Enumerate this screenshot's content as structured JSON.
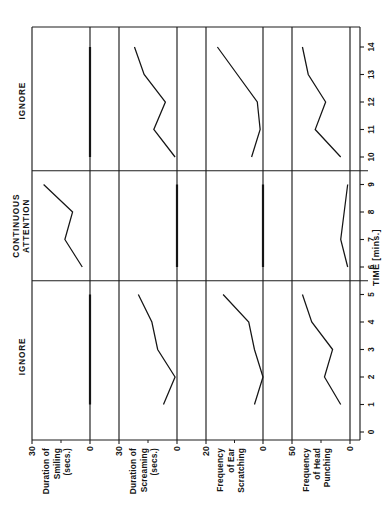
{
  "figure": {
    "orientation": "rotated-90-ccw",
    "time_axis": {
      "title": "TIME [mins.]",
      "ticks": [
        0,
        1,
        2,
        3,
        4,
        5,
        6,
        7,
        8,
        9,
        10,
        11,
        12,
        13,
        14
      ],
      "tick_labels": [
        "0",
        "1",
        "2",
        "3",
        "4",
        "5",
        "6",
        "7",
        "8",
        "9",
        "10",
        "11",
        "12",
        "13",
        "14"
      ],
      "range": [
        0,
        14.6
      ],
      "unit": "mins."
    },
    "phases": [
      {
        "name": "IGNORE",
        "start": 0,
        "end": 5.5
      },
      {
        "name": "CONTINUOUS\nATTENTION",
        "line1": "CONTINUOUS",
        "line2": "ATTENTION",
        "start": 5.5,
        "end": 9.5
      },
      {
        "name": "IGNORE",
        "start": 9.5,
        "end": 14.6
      }
    ],
    "colors": {
      "ink": "#151515",
      "axis": "#1d1d1d",
      "background": "#ffffff"
    }
  },
  "chart_data": {
    "type": "line",
    "title": "",
    "xlabel": "TIME [mins.]",
    "xlim": [
      0,
      14.6
    ],
    "grid": false,
    "legend": "none",
    "annotations": [
      "IGNORE",
      "CONTINUOUS ATTENTION",
      "IGNORE"
    ],
    "x": [
      1,
      2,
      3,
      4,
      5,
      6,
      7,
      8,
      9,
      10,
      11,
      12,
      13,
      14
    ],
    "panels": [
      {
        "label_lines": [
          "Duration  of",
          "Smiling",
          "(secs.)"
        ],
        "label_full": "Duration of Smiling (secs.)",
        "ylabel": "Duration of Smiling (secs.)",
        "ylim": [
          0,
          30
        ],
        "ytick_labels": [
          "0",
          "30"
        ],
        "yticks": [
          0,
          30
        ],
        "yminor": [
          15
        ],
        "values": [
          0,
          0,
          0,
          0,
          0,
          0,
          13,
          9,
          24,
          0,
          0,
          0,
          0,
          0
        ],
        "segments": [
          {
            "phase": "IGNORE",
            "x": [
              1,
              2,
              3,
              4,
              5
            ],
            "y": [
              0,
              0,
              0,
              0,
              0
            ]
          },
          {
            "phase": "CONTINUOUS ATTENTION",
            "x": [
              6,
              7,
              8,
              9
            ],
            "y": [
              4,
              13,
              9,
              24
            ]
          },
          {
            "phase": "IGNORE",
            "x": [
              10,
              11,
              12,
              13,
              14
            ],
            "y": [
              0,
              0,
              0,
              0,
              0
            ]
          }
        ]
      },
      {
        "label_lines": [
          "Duration of",
          "Screaming",
          "(secs.)"
        ],
        "label_full": "Duration of Screaming (secs.)",
        "ylabel": "Duration of Screaming (secs.)",
        "ylim": [
          0,
          30
        ],
        "ytick_labels": [
          "0",
          "30"
        ],
        "yticks": [
          0,
          30
        ],
        "yminor": [
          15
        ],
        "values": [
          7,
          1,
          10,
          13,
          20,
          0,
          0,
          0,
          0,
          18,
          6,
          14,
          8,
          22
        ],
        "segments": [
          {
            "phase": "IGNORE",
            "x": [
              1,
              2,
              3,
              4,
              5
            ],
            "y": [
              7,
              1,
              10,
              13,
              20
            ]
          },
          {
            "phase": "CONTINUOUS ATTENTION",
            "x": [
              6,
              7,
              8,
              9
            ],
            "y": [
              0,
              0,
              0,
              0
            ]
          },
          {
            "phase": "IGNORE",
            "x": [
              10,
              11,
              12,
              13,
              14
            ],
            "y": [
              1,
              12,
              6,
              17,
              22
            ]
          }
        ]
      },
      {
        "label_lines": [
          "Frequency",
          "of  Ear",
          "Scratching"
        ],
        "label_full": "Frequency of Ear Scratching",
        "ylabel": "Frequency of Ear Scratching",
        "ylim": [
          0,
          20
        ],
        "ytick_labels": [
          "0",
          "20"
        ],
        "yticks": [
          0,
          20
        ],
        "yminor": [
          10
        ],
        "values": [
          3,
          0,
          3,
          5,
          14,
          0,
          0,
          0,
          0,
          3,
          1,
          2,
          9,
          16
        ],
        "segments": [
          {
            "phase": "IGNORE",
            "x": [
              1,
              2,
              3,
              4,
              5
            ],
            "y": [
              3,
              0,
              3,
              5,
              14
            ]
          },
          {
            "phase": "CONTINUOUS ATTENTION",
            "x": [
              6,
              7,
              8,
              9
            ],
            "y": [
              0,
              0,
              0,
              0
            ]
          },
          {
            "phase": "IGNORE",
            "x": [
              10,
              11,
              12,
              13,
              14
            ],
            "y": [
              4,
              1,
              2,
              9,
              16
            ]
          }
        ]
      },
      {
        "label_lines": [
          "Frequency",
          "of  Head",
          "Punching"
        ],
        "label_full": "Frequency of Head Punching",
        "ylabel": "Frequency of Head Punching",
        "ylim": [
          0,
          50
        ],
        "ytick_labels": [
          "0",
          "50"
        ],
        "yticks": [
          0,
          50
        ],
        "yminor": [
          25
        ],
        "values": [
          8,
          22,
          15,
          33,
          41,
          3,
          8,
          5,
          2,
          8,
          30,
          21,
          36,
          41
        ],
        "segments": [
          {
            "phase": "IGNORE",
            "x": [
              1,
              2,
              3,
              4,
              5
            ],
            "y": [
              8,
              22,
              15,
              33,
              41
            ]
          },
          {
            "phase": "CONTINUOUS ATTENTION",
            "x": [
              6,
              7,
              8,
              9
            ],
            "y": [
              2,
              8,
              5,
              2
            ]
          },
          {
            "phase": "IGNORE",
            "x": [
              10,
              11,
              12,
              13,
              14
            ],
            "y": [
              8,
              30,
              21,
              36,
              41
            ]
          }
        ]
      }
    ]
  }
}
